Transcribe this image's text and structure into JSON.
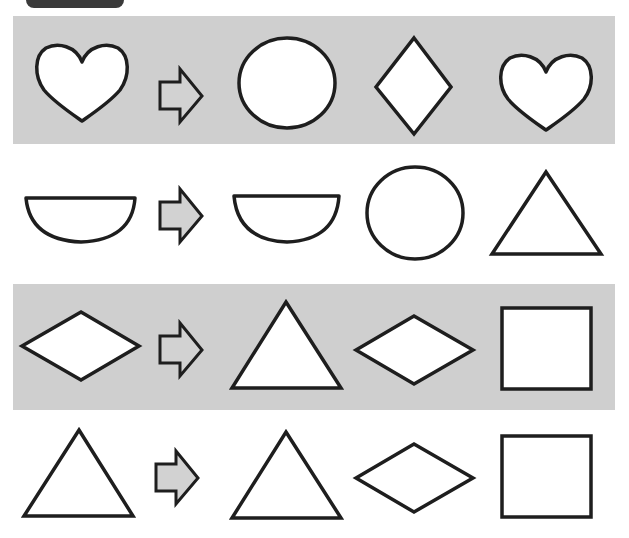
{
  "worksheet": {
    "type": "shape-matching",
    "colors": {
      "band": "#cfcfcf",
      "stroke": "#1e1e1e",
      "arrow_fill": "#d2d2d2",
      "tab": "#3a3a3a"
    },
    "rows": [
      {
        "index": 1,
        "band": "gray",
        "target": "heart-icon",
        "options": [
          "circle-icon",
          "diamond-tall-icon",
          "heart-icon"
        ]
      },
      {
        "index": 2,
        "band": "white",
        "target": "semicircle-icon",
        "options": [
          "semicircle-icon",
          "circle-icon",
          "triangle-icon"
        ]
      },
      {
        "index": 3,
        "band": "gray",
        "target": "diamond-wide-icon",
        "options": [
          "triangle-icon",
          "diamond-wide-icon",
          "square-icon"
        ]
      },
      {
        "index": 4,
        "band": "white",
        "target": "triangle-icon",
        "options": [
          "triangle-icon",
          "diamond-wide-icon",
          "square-icon"
        ]
      }
    ]
  }
}
